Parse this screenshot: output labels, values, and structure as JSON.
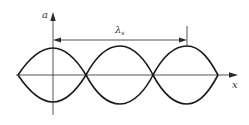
{
  "diagram": {
    "axes": {
      "vertical_label": "a",
      "horizontal_label": "x"
    },
    "dimension": {
      "symbol": "λ",
      "subscript": "s"
    },
    "colors": {
      "stroke": "#1a1a1a",
      "background": "#ffffff"
    }
  }
}
